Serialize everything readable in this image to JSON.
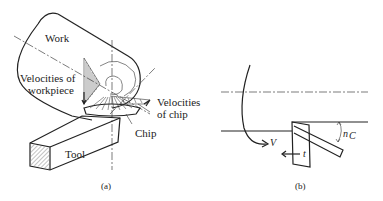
{
  "figure_a": {
    "caption": "(a)",
    "labels": {
      "work": "Work",
      "velocities_workpiece_1": "Velocities of",
      "velocities_workpiece_2": "workpiece",
      "velocities_chip_1": "Velocities",
      "velocities_chip_2": "of chip",
      "chip": "Chip",
      "tool": "Tool"
    }
  },
  "figure_b": {
    "caption": "(b)",
    "labels": {
      "velocity": "V",
      "feed": "t",
      "angle": "n",
      "angle_sub": "C"
    }
  }
}
